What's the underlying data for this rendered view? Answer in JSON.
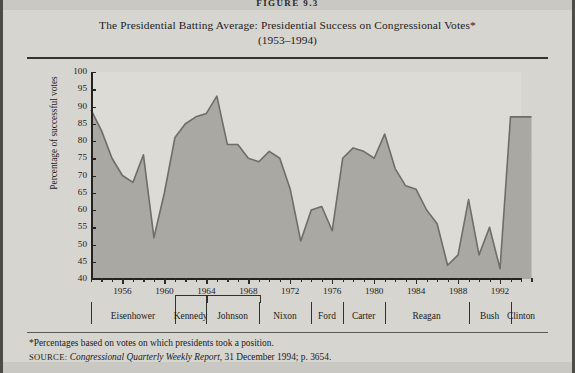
{
  "figure": {
    "number_label": "FIGURE 9.3",
    "title_line1": "The Presidential Batting Average: Presidential Success on Congressional Votes*",
    "title_line2": "(1953–1994)"
  },
  "footnotes": {
    "asterisk_note": "*Percentages based on votes on which presidents took a position.",
    "source_kicker": "SOURCE:",
    "source_italic": "Congressional Quarterly Weekly Report",
    "source_rest": ", 31 December 1994; p. 3654."
  },
  "colors": {
    "page_background": "#c9c8c3",
    "card_background": "#d6d5d0",
    "plot_background": "#dcdbd6",
    "area_fill": "#a9a8a3",
    "series_line": "#6e6d69",
    "axis": "#232220",
    "text": "#1d1c1a"
  },
  "presidents": [
    {
      "name": "Eisenhower",
      "start": 1953,
      "end": 1961
    },
    {
      "name": "Kennedy",
      "start": 1961,
      "end": 1964
    },
    {
      "name": "Johnson",
      "start": 1964,
      "end": 1969
    },
    {
      "name": "Nixon",
      "start": 1969,
      "end": 1974
    },
    {
      "name": "Ford",
      "start": 1974,
      "end": 1977
    },
    {
      "name": "Carter",
      "start": 1977,
      "end": 1981
    },
    {
      "name": "Reagan",
      "start": 1981,
      "end": 1989
    },
    {
      "name": "Bush",
      "start": 1989,
      "end": 1993
    },
    {
      "name": "Clinton",
      "start": 1993,
      "end": 1995
    }
  ],
  "chart_data": {
    "type": "area",
    "title": "The Presidential Batting Average: Presidential Success on Congressional Votes*",
    "subtitle": "(1953–1994)",
    "xlabel": "",
    "ylabel": "Percentage of successful votes",
    "xlim": [
      1953,
      1994
    ],
    "ylim": [
      40,
      100
    ],
    "ytick_step": 5,
    "yticks": [
      40,
      45,
      50,
      55,
      60,
      65,
      70,
      75,
      80,
      85,
      90,
      95,
      100
    ],
    "xticks_labeled": [
      1956,
      1960,
      1964,
      1968,
      1972,
      1976,
      1980,
      1984,
      1988,
      1992
    ],
    "xtick_minor_step": 1,
    "grid": false,
    "legend": "none",
    "x": [
      1953,
      1954,
      1955,
      1956,
      1957,
      1958,
      1959,
      1960,
      1961,
      1962,
      1963,
      1964,
      1965,
      1966,
      1967,
      1968,
      1969,
      1970,
      1971,
      1972,
      1973,
      1974,
      1975,
      1976,
      1977,
      1978,
      1979,
      1980,
      1981,
      1982,
      1983,
      1984,
      1985,
      1986,
      1987,
      1988,
      1989,
      1990,
      1991,
      1992,
      1993,
      1994
    ],
    "values": [
      89,
      83,
      75,
      70,
      68,
      76,
      52,
      65,
      81,
      85,
      87,
      88,
      93,
      79,
      79,
      75,
      74,
      77,
      75,
      66,
      51,
      60,
      61,
      54,
      75,
      78,
      77,
      75,
      82,
      72,
      67,
      66,
      60,
      56,
      44,
      47,
      63,
      47,
      55,
      43,
      87,
      87
    ],
    "annotations": [
      {
        "text": "*Percentages based on votes on which presidents took a position."
      }
    ]
  },
  "yaxis_labels": [
    "100",
    "95",
    "90",
    "85",
    "80",
    "75",
    "70",
    "65",
    "60",
    "55",
    "50",
    "45",
    "40"
  ]
}
